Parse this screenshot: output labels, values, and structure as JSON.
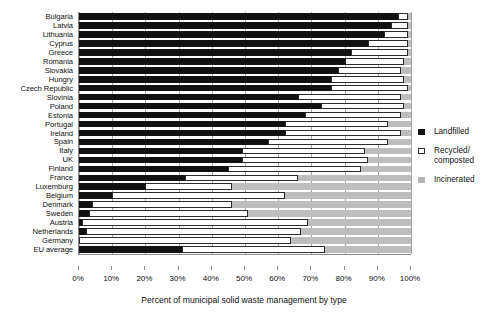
{
  "chart_data": {
    "type": "bar",
    "orientation": "horizontal",
    "stacked": true,
    "title": "",
    "xlabel": "Percent of municipal solid waste management by type",
    "ylabel": "",
    "xlim": [
      0,
      100
    ],
    "xticks": [
      "0%",
      "10%",
      "20%",
      "30%",
      "40%",
      "50%",
      "60%",
      "70%",
      "80%",
      "90%",
      "100%"
    ],
    "grid": true,
    "legend_position": "right",
    "categories": [
      "Bulgaria",
      "Latvia",
      "Lithuania",
      "Cyprus",
      "Greece",
      "Romania",
      "Slovakia",
      "Hungry",
      "Czech Republic",
      "Slovinia",
      "Poland",
      "Estonia",
      "Portugal",
      "Ireland",
      "Spain",
      "Italy",
      "UK",
      "Finland",
      "France",
      "Luxemburg",
      "Belgium",
      "Denmark",
      "Sweden",
      "Austria",
      "Netherlands",
      "Germany",
      "EU average"
    ],
    "series": [
      {
        "name": "Landfilled",
        "color": "#111111",
        "values": [
          96,
          94,
          92,
          87,
          82,
          80,
          78,
          76,
          76,
          66,
          73,
          68,
          62,
          62,
          57,
          49,
          49,
          45,
          32,
          20,
          10,
          4,
          3,
          1,
          2,
          0,
          31
        ]
      },
      {
        "name": "Recycled/ composted",
        "color": "#ffffff",
        "values": [
          3,
          5,
          7,
          12,
          17,
          18,
          19,
          22,
          23,
          31,
          25,
          29,
          31,
          35,
          36,
          37,
          38,
          40,
          34,
          26,
          52,
          42,
          48,
          68,
          65,
          64,
          43
        ]
      },
      {
        "name": "Incinerated",
        "color": "#b5b5b5",
        "values": [
          1,
          1,
          1,
          1,
          1,
          2,
          3,
          2,
          1,
          3,
          2,
          3,
          7,
          3,
          7,
          14,
          13,
          15,
          34,
          54,
          38,
          54,
          49,
          31,
          33,
          36,
          26
        ]
      }
    ]
  },
  "legend": {
    "items": [
      {
        "label": "Landfilled",
        "label2": "",
        "swatch": "filled-square-black"
      },
      {
        "label": "Recycled/",
        "label2": "composted",
        "swatch": "open-square"
      },
      {
        "label": "Incinerated",
        "label2": "",
        "swatch": "filled-square-gray"
      }
    ]
  }
}
